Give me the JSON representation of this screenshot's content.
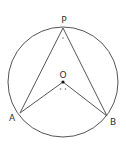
{
  "diagram": {
    "type": "circle-geometry",
    "circle": {
      "center_label": "O",
      "cx": 63,
      "cy": 82,
      "r": 55
    },
    "points": [
      {
        "id": "P",
        "label": "P",
        "x": 63,
        "y": 28,
        "label_x": 64,
        "label_y": 20
      },
      {
        "id": "O",
        "label": "O",
        "x": 63,
        "y": 82,
        "label_x": 63,
        "label_y": 75
      },
      {
        "id": "A",
        "label": "A",
        "x": 20,
        "y": 113,
        "label_x": 12,
        "label_y": 120
      },
      {
        "id": "B",
        "label": "B",
        "x": 107,
        "y": 116,
        "label_x": 112,
        "label_y": 124
      }
    ],
    "segments": [
      [
        "P",
        "A"
      ],
      [
        "P",
        "B"
      ],
      [
        "O",
        "A"
      ],
      [
        "O",
        "B"
      ]
    ],
    "angle_marks": [
      {
        "at": "P",
        "dots": 1
      },
      {
        "at": "O",
        "dots": 2
      }
    ],
    "labels": {
      "P": "P",
      "O": "O",
      "A": "A",
      "B": "B"
    },
    "colors": {
      "stroke": "#555555",
      "text": "#333333",
      "dot": "#111111"
    }
  }
}
